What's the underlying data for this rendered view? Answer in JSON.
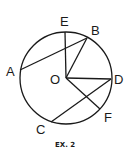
{
  "figure": {
    "caption": "EX. 2",
    "center_label": "O",
    "points": [
      {
        "label": "E",
        "x": 65,
        "y": 32
      },
      {
        "label": "B",
        "x": 87,
        "y": 38
      },
      {
        "label": "A",
        "x": 20,
        "y": 70
      },
      {
        "label": "D",
        "x": 111,
        "y": 79
      },
      {
        "label": "F",
        "x": 100,
        "y": 109
      },
      {
        "label": "C",
        "x": 51,
        "y": 122
      }
    ],
    "segments": [
      "OE",
      "OB",
      "OD",
      "OF",
      "AB",
      "CD"
    ],
    "colors": {
      "stroke": "#1a1a1a",
      "background": "#ffffff"
    }
  }
}
